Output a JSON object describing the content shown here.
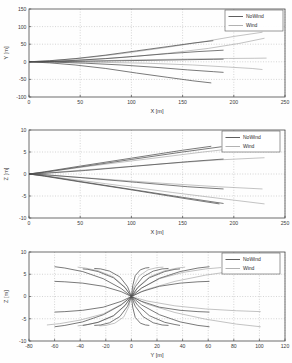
{
  "figure": {
    "title": "",
    "background": "#fefefe",
    "panel_count": 3
  },
  "legend": {
    "entries": [
      {
        "label": "NoWind",
        "color": "#4d4d4d"
      },
      {
        "label": "Wind",
        "color": "#a9a9a9"
      }
    ],
    "position": "top-right"
  },
  "chart_data": [
    {
      "type": "line",
      "title": "",
      "xlabel": "X [m]",
      "ylabel": "Y [m]",
      "xlim": [
        0,
        250
      ],
      "ylim": [
        -100,
        150
      ],
      "xticks": [
        0,
        50,
        100,
        150,
        200,
        250
      ],
      "yticks": [
        -100,
        -50,
        0,
        50,
        100,
        150
      ],
      "grid": true,
      "legend": [
        "NoWind",
        "Wind"
      ],
      "series": [
        {
          "name": "NoWind",
          "color": "#4d4d4d",
          "trajectories": [
            {
              "x": [
                0,
                20,
                45,
                75,
                105,
                135,
                160,
                180
              ],
              "y": [
                0,
                3,
                9,
                19,
                31,
                43,
                53,
                60
              ]
            },
            {
              "x": [
                0,
                20,
                45,
                75,
                105,
                135,
                165,
                190
              ],
              "y": [
                0,
                1,
                4,
                9,
                16,
                23,
                29,
                33
              ]
            },
            {
              "x": [
                0,
                25,
                55,
                90,
                125,
                155,
                180,
                190
              ],
              "y": [
                0,
                0.5,
                1.5,
                3,
                4.5,
                6,
                7,
                7.5
              ]
            },
            {
              "x": [
                0,
                25,
                55,
                90,
                125,
                155,
                180,
                190
              ],
              "y": [
                0,
                -1,
                -4,
                -9,
                -16,
                -23,
                -28,
                -30
              ]
            },
            {
              "x": [
                0,
                20,
                45,
                75,
                105,
                135,
                160,
                178
              ],
              "y": [
                0,
                -3,
                -9,
                -19,
                -32,
                -44,
                -54,
                -60
              ]
            }
          ]
        },
        {
          "name": "Wind",
          "color": "#a9a9a9",
          "trajectories": [
            {
              "x": [
                0,
                25,
                55,
                90,
                130,
                170,
                200,
                228
              ],
              "y": [
                0,
                4,
                11,
                23,
                39,
                57,
                72,
                84
              ]
            },
            {
              "x": [
                0,
                25,
                55,
                95,
                135,
                175,
                205,
                230
              ],
              "y": [
                0,
                2,
                6,
                13,
                24,
                38,
                52,
                67
              ]
            },
            {
              "x": [
                0,
                30,
                70,
                115,
                160,
                195,
                220,
                232
              ],
              "y": [
                0,
                1,
                3,
                6,
                8,
                9.5,
                10,
                10.5
              ]
            },
            {
              "x": [
                0,
                30,
                70,
                115,
                160,
                195,
                218,
                228
              ],
              "y": [
                0,
                -0.5,
                -1.5,
                -4,
                -9,
                -15,
                -19,
                -22
              ]
            }
          ]
        }
      ]
    },
    {
      "type": "line",
      "title": "",
      "xlabel": "X [m]",
      "ylabel": "Z [m]",
      "xlim": [
        0,
        250
      ],
      "ylim": [
        -10,
        10
      ],
      "xticks": [
        0,
        50,
        100,
        150,
        200,
        250
      ],
      "yticks": [
        -10,
        -5,
        0,
        5,
        10
      ],
      "grid": true,
      "legend": [
        "NoWind",
        "Wind"
      ],
      "series": [
        {
          "name": "NoWind",
          "color": "#4d4d4d",
          "trajectories": [
            {
              "x": [
                0,
                15,
                50,
                100,
                150,
                178
              ],
              "y": [
                0,
                0.5,
                1.8,
                3.6,
                5.4,
                6.3
              ]
            },
            {
              "x": [
                0,
                15,
                50,
                100,
                150,
                188
              ],
              "y": [
                0,
                0.4,
                1.6,
                3.3,
                5.0,
                6.2
              ]
            },
            {
              "x": [
                0,
                18,
                55,
                105,
                155,
                190
              ],
              "y": [
                0,
                0.2,
                0.8,
                1.8,
                2.8,
                3.4
              ]
            },
            {
              "x": [
                0,
                18,
                55,
                105,
                155,
                190
              ],
              "y": [
                0,
                -0.2,
                -0.9,
                -1.9,
                -2.9,
                -3.4
              ]
            },
            {
              "x": [
                0,
                15,
                50,
                100,
                150,
                186
              ],
              "y": [
                0,
                -0.5,
                -1.8,
                -3.6,
                -5.5,
                -6.8
              ]
            },
            {
              "x": [
                0,
                15,
                50,
                100,
                150,
                190
              ],
              "y": [
                0,
                -0.4,
                -1.7,
                -3.5,
                -5.3,
                -6.7
              ]
            }
          ]
        },
        {
          "name": "Wind",
          "color": "#a9a9a9",
          "trajectories": [
            {
              "x": [
                0,
                25,
                70,
                130,
                185,
                230
              ],
              "y": [
                0,
                0.4,
                1.2,
                2.3,
                3.2,
                3.7
              ]
            },
            {
              "x": [
                0,
                25,
                70,
                130,
                185,
                228
              ],
              "y": [
                0,
                -0.4,
                -1.1,
                -2.1,
                -2.9,
                -3.4
              ]
            },
            {
              "x": [
                0,
                25,
                75,
                140,
                195,
                230
              ],
              "y": [
                0,
                -0.7,
                -2.2,
                -4.2,
                -5.8,
                -6.8
              ]
            },
            {
              "x": [
                0,
                20,
                60,
                115,
                170,
                212
              ],
              "y": [
                0,
                0.55,
                1.8,
                3.4,
                5.0,
                6.1
              ]
            }
          ]
        }
      ]
    },
    {
      "type": "line",
      "title": "",
      "xlabel": "Y [m]",
      "ylabel": "Z [m]",
      "xlim": [
        -80,
        120
      ],
      "ylim": [
        -10,
        10
      ],
      "xticks": [
        -80,
        -60,
        -40,
        -20,
        0,
        20,
        40,
        60,
        80,
        100,
        120
      ],
      "yticks": [
        -10,
        -5,
        0,
        5,
        10
      ],
      "grid": true,
      "legend": [
        "NoWind",
        "Wind"
      ],
      "series": [
        {
          "name": "NoWind",
          "color": "#4d4d4d",
          "trajectories": [
            {
              "x": [
                0,
                -8,
                -22,
                -38,
                -52,
                -60
              ],
              "y": [
                0,
                1.8,
                4.0,
                5.6,
                6.4,
                6.7
              ]
            },
            {
              "x": [
                0,
                -8,
                -22,
                -38,
                -52,
                -60
              ],
              "y": [
                0,
                1.1,
                2.3,
                3.0,
                3.3,
                3.4
              ]
            },
            {
              "x": [
                0,
                -5,
                -14,
                -26,
                -34,
                -38
              ],
              "y": [
                0,
                2.0,
                4.2,
                5.6,
                6.1,
                6.2
              ]
            },
            {
              "x": [
                0,
                -3,
                -9,
                -17,
                -24,
                -29
              ],
              "y": [
                0,
                2.2,
                4.4,
                5.7,
                6.2,
                6.3
              ]
            },
            {
              "x": [
                0,
                -8,
                -22,
                -38,
                -52,
                -60
              ],
              "y": [
                0,
                -1.1,
                -2.4,
                -3.1,
                -3.4,
                -3.5
              ]
            },
            {
              "x": [
                0,
                -8,
                -22,
                -38,
                -52,
                -60
              ],
              "y": [
                0,
                -1.9,
                -4.1,
                -5.7,
                -6.5,
                -6.8
              ]
            },
            {
              "x": [
                0,
                -5,
                -14,
                -26,
                -34,
                -38
              ],
              "y": [
                0,
                -2.0,
                -4.3,
                -5.8,
                -6.3,
                -6.5
              ]
            },
            {
              "x": [
                0,
                -3,
                -9,
                -17,
                -24,
                -29
              ],
              "y": [
                0,
                -2.2,
                -4.5,
                -5.9,
                -6.4,
                -6.5
              ]
            },
            {
              "x": [
                0,
                8,
                22,
                38,
                52,
                61
              ],
              "y": [
                0,
                1.9,
                4.1,
                5.6,
                6.4,
                6.7
              ]
            },
            {
              "x": [
                0,
                8,
                22,
                38,
                52,
                61
              ],
              "y": [
                0,
                1.1,
                2.3,
                3.0,
                3.3,
                3.4
              ]
            },
            {
              "x": [
                0,
                5,
                14,
                26,
                34,
                38
              ],
              "y": [
                0,
                2.0,
                4.2,
                5.6,
                6.1,
                6.2
              ]
            },
            {
              "x": [
                0,
                3,
                9,
                17,
                24,
                29
              ],
              "y": [
                0,
                2.2,
                4.4,
                5.7,
                6.2,
                6.3
              ]
            },
            {
              "x": [
                0,
                8,
                22,
                38,
                52,
                61
              ],
              "y": [
                0,
                -1.1,
                -2.4,
                -3.1,
                -3.4,
                -3.5
              ]
            },
            {
              "x": [
                0,
                8,
                22,
                38,
                52,
                61
              ],
              "y": [
                0,
                -1.9,
                -4.1,
                -5.7,
                -6.5,
                -6.8
              ]
            },
            {
              "x": [
                0,
                5,
                14,
                26,
                34,
                38
              ],
              "y": [
                0,
                -2.0,
                -4.3,
                -5.8,
                -6.3,
                -6.5
              ]
            },
            {
              "x": [
                0,
                3,
                9,
                17,
                24,
                29
              ],
              "y": [
                0,
                -2.2,
                -4.5,
                -5.9,
                -6.4,
                -6.5
              ]
            },
            {
              "x": [
                0,
                1,
                3,
                7,
                11,
                14
              ],
              "y": [
                0,
                2.4,
                4.7,
                6.0,
                6.4,
                6.5
              ]
            },
            {
              "x": [
                0,
                1,
                3,
                7,
                11,
                14
              ],
              "y": [
                0,
                -2.4,
                -4.7,
                -6.0,
                -6.4,
                -6.5
              ]
            }
          ]
        },
        {
          "name": "Wind",
          "color": "#a9a9a9",
          "trajectories": [
            {
              "x": [
                0,
                12,
                34,
                58,
                82,
                101
              ],
              "y": [
                0,
                1.6,
                3.4,
                4.8,
                5.8,
                6.3
              ]
            },
            {
              "x": [
                0,
                12,
                34,
                58,
                82,
                101
              ],
              "y": [
                0,
                -1.0,
                -2.1,
                -2.8,
                -3.2,
                -3.4
              ]
            },
            {
              "x": [
                0,
                12,
                34,
                58,
                82,
                101
              ],
              "y": [
                0,
                -1.7,
                -3.6,
                -5.1,
                -6.2,
                -6.8
              ]
            },
            {
              "x": [
                0,
                8,
                22,
                40,
                58,
                70
              ],
              "y": [
                0,
                1.9,
                4.0,
                5.4,
                6.2,
                6.5
              ]
            },
            {
              "x": [
                0,
                5,
                14,
                26,
                36,
                42
              ],
              "y": [
                0,
                2.1,
                4.4,
                5.8,
                6.4,
                6.6
              ]
            },
            {
              "x": [
                0,
                -5,
                -14,
                -26,
                -36,
                -42
              ],
              "y": [
                0,
                2.1,
                4.4,
                5.8,
                6.4,
                6.6
              ]
            },
            {
              "x": [
                0,
                -8,
                -22,
                -40,
                -56,
                -66
              ],
              "y": [
                0,
                -1.8,
                -3.9,
                -5.3,
                -6.1,
                -6.4
              ]
            },
            {
              "x": [
                0,
                -5,
                -14,
                -26,
                -36,
                -42
              ],
              "y": [
                0,
                -2.1,
                -4.4,
                -5.8,
                -6.4,
                -6.6
              ]
            },
            {
              "x": [
                0,
                2,
                6,
                13,
                20,
                25
              ],
              "y": [
                0,
                2.3,
                4.6,
                6.0,
                6.5,
                6.6
              ]
            },
            {
              "x": [
                0,
                -2,
                -6,
                -13,
                -20,
                -25
              ],
              "y": [
                0,
                -2.3,
                -4.6,
                -6.0,
                -6.5,
                -6.6
              ]
            }
          ]
        }
      ]
    }
  ]
}
